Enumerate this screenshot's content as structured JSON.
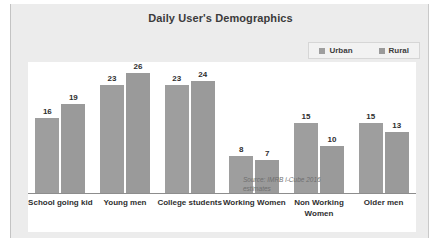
{
  "chart_data": {
    "type": "bar",
    "title": "Daily User's Demographics",
    "xlabel": "",
    "ylabel": "",
    "ylim": [
      0,
      28
    ],
    "grid": false,
    "legend_position": "top-right",
    "categories": [
      "School going kid",
      "Young men",
      "College students",
      "Working Women",
      "Non Working Women",
      "Older men"
    ],
    "series": [
      {
        "name": "Urban",
        "color": "#9e9e9e",
        "values": [
          16,
          23,
          23,
          8,
          15,
          15
        ]
      },
      {
        "name": "Rural",
        "color": "#9a9a9a",
        "values": [
          19,
          26,
          24,
          7,
          10,
          13
        ]
      }
    ],
    "annotations": [
      {
        "name": "source",
        "line1": "Source: IMRB i-Cube 2016",
        "line2": "estimates"
      }
    ]
  },
  "legend": {
    "items": [
      {
        "label": "Urban",
        "color": "#9e9e9e"
      },
      {
        "label": "Rural",
        "color": "#9a9a9a"
      }
    ]
  },
  "colors": {
    "frame_bg": "#ececec",
    "plot_bg": "#ffffff",
    "bar_urban": "#9e9e9e",
    "bar_rural": "#9a9a9a",
    "title_text": "#3b3b3b",
    "label_text": "#2f2f2f",
    "axis_line": "#8d8d8d"
  }
}
